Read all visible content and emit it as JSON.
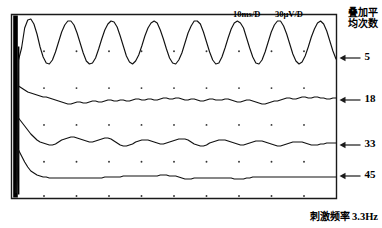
{
  "figure": {
    "scale_time_label": "10ms/D",
    "scale_amp_label": "30μV/D",
    "legend_title_line1": "叠加平",
    "legend_title_line2": "均次数",
    "caption_cjk": "刺激频率",
    "caption_value": "3.3Hz",
    "axis_color": "#1a1a1a",
    "trace_color": "#111111",
    "grid_dot_color": "#333333",
    "artifact_color": "#000000"
  },
  "chart_data": {
    "type": "line",
    "title": "",
    "subtitle": "",
    "xlabel": "",
    "ylabel": "",
    "xlim": [
      0,
      100
    ],
    "ylim": [
      0,
      100
    ],
    "grid": "dots",
    "legend_position": "right",
    "x_scale_per_division": "10ms/D",
    "y_scale_per_division": "30μV/D",
    "stimulus_frequency_hz": 3.3,
    "grid_divisions_x": 10,
    "grid_divisions_y": 5,
    "annotations": [
      {
        "text": "10ms/D",
        "x": 248,
        "y": 16
      },
      {
        "text": "30μV/D",
        "x": 290,
        "y": 16
      }
    ],
    "series": [
      {
        "name": "5",
        "label": "5",
        "averages": 5,
        "label_y": 58,
        "baseline_y": 60,
        "amplitude": 33,
        "cycles": 5.6,
        "description": "large sinusoidal oscillation, least averaging, most noise-free large response",
        "y": [
          60,
          48,
          28,
          20,
          19,
          24,
          34,
          47,
          57,
          63,
          64,
          60,
          52,
          42,
          32,
          25,
          21,
          21,
          25,
          33,
          43,
          53,
          61,
          64,
          63,
          58,
          49,
          39,
          30,
          24,
          21,
          22,
          27,
          36,
          46,
          56,
          62,
          64,
          61,
          55,
          46,
          36,
          28,
          23,
          21,
          23,
          30,
          39,
          49,
          58,
          63,
          64,
          60,
          53,
          43,
          33,
          26,
          21,
          21,
          24,
          32,
          42,
          52,
          60,
          64,
          63,
          57,
          48,
          38,
          29,
          23,
          21,
          23,
          28,
          38,
          48,
          57,
          63,
          64,
          60,
          52,
          42,
          32,
          25,
          21,
          21,
          26,
          34,
          44,
          54,
          61,
          64,
          62,
          56,
          47,
          37,
          29,
          23,
          21,
          24,
          31,
          41,
          51,
          59
        ]
      },
      {
        "name": "18",
        "label": "18",
        "averages": 18,
        "label_y": 100,
        "baseline_y": 99,
        "amplitude": 5,
        "cycles": 5.6,
        "description": "small noisy near-flat trace after rapid decay from artifact",
        "y": [
          86,
          88,
          90,
          92,
          93,
          94,
          95,
          96,
          97,
          97,
          98,
          99,
          100,
          101,
          102,
          103,
          104,
          104,
          103,
          102,
          102,
          103,
          103,
          102,
          101,
          101,
          102,
          102,
          101,
          100,
          100,
          101,
          101,
          100,
          100,
          101,
          101,
          100,
          99,
          99,
          100,
          100,
          99,
          99,
          100,
          100,
          99,
          98,
          98,
          99,
          99,
          98,
          98,
          99,
          100,
          100,
          99,
          99,
          100,
          101,
          101,
          100,
          99,
          99,
          100,
          100,
          100,
          99,
          99,
          100,
          101,
          102,
          102,
          101,
          100,
          100,
          101,
          102,
          103,
          104,
          104,
          103,
          102,
          101,
          101,
          100,
          99,
          98,
          98,
          99,
          99,
          98,
          97,
          97,
          98,
          98,
          97,
          97,
          98,
          98,
          99,
          99,
          98,
          98
        ]
      },
      {
        "name": "33",
        "label": "33",
        "averages": 33,
        "label_y": 145,
        "baseline_y": 144,
        "amplitude": 9,
        "cycles": 5.6,
        "description": "medium amplitude damped sinusoid, intermediate averaging",
        "y": [
          118,
          122,
          126,
          130,
          134,
          137,
          140,
          142,
          143,
          144,
          145,
          145,
          144,
          142,
          140,
          139,
          138,
          137,
          137,
          138,
          139,
          140,
          141,
          142,
          142,
          141,
          140,
          139,
          138,
          138,
          139,
          141,
          143,
          145,
          146,
          146,
          145,
          144,
          142,
          141,
          140,
          140,
          140,
          141,
          142,
          143,
          144,
          144,
          143,
          142,
          141,
          140,
          139,
          139,
          139,
          140,
          142,
          144,
          145,
          146,
          146,
          145,
          143,
          142,
          141,
          140,
          140,
          140,
          141,
          142,
          143,
          144,
          145,
          145,
          144,
          143,
          142,
          141,
          141,
          141,
          142,
          143,
          144,
          145,
          146,
          146,
          145,
          144,
          143,
          142,
          142,
          142,
          142,
          143,
          144,
          145,
          145,
          145,
          144,
          144,
          143,
          143,
          143,
          143
        ]
      },
      {
        "name": "45",
        "label": "45",
        "averages": 45,
        "label_y": 176,
        "baseline_y": 176,
        "amplitude": 3,
        "cycles": 5.6,
        "description": "nearly flat trace, most averaging, smallest residual oscillation",
        "y": [
          150,
          156,
          162,
          167,
          171,
          173,
          175,
          176,
          177,
          177,
          178,
          178,
          178,
          178,
          178,
          178,
          178,
          178,
          178,
          178,
          178,
          178,
          178,
          178,
          178,
          178,
          178,
          178,
          177,
          177,
          177,
          177,
          177,
          177,
          176,
          176,
          176,
          176,
          176,
          176,
          176,
          176,
          176,
          176,
          176,
          176,
          175,
          175,
          175,
          176,
          176,
          176,
          177,
          178,
          179,
          179,
          179,
          178,
          178,
          178,
          178,
          178,
          178,
          178,
          178,
          178,
          178,
          178,
          178,
          178,
          179,
          179,
          179,
          179,
          178,
          178,
          177,
          177,
          177,
          177,
          177,
          177,
          177,
          177,
          177,
          177,
          177,
          177,
          177,
          177,
          177,
          177,
          177,
          177,
          177,
          177,
          177,
          177,
          177,
          177,
          177,
          177,
          177,
          177
        ]
      }
    ],
    "y_axis_labels": [
      {
        "value": "5",
        "y": 58
      },
      {
        "value": "18",
        "y": 100
      },
      {
        "value": "33",
        "y": 145
      },
      {
        "value": "45",
        "y": 176
      }
    ]
  }
}
